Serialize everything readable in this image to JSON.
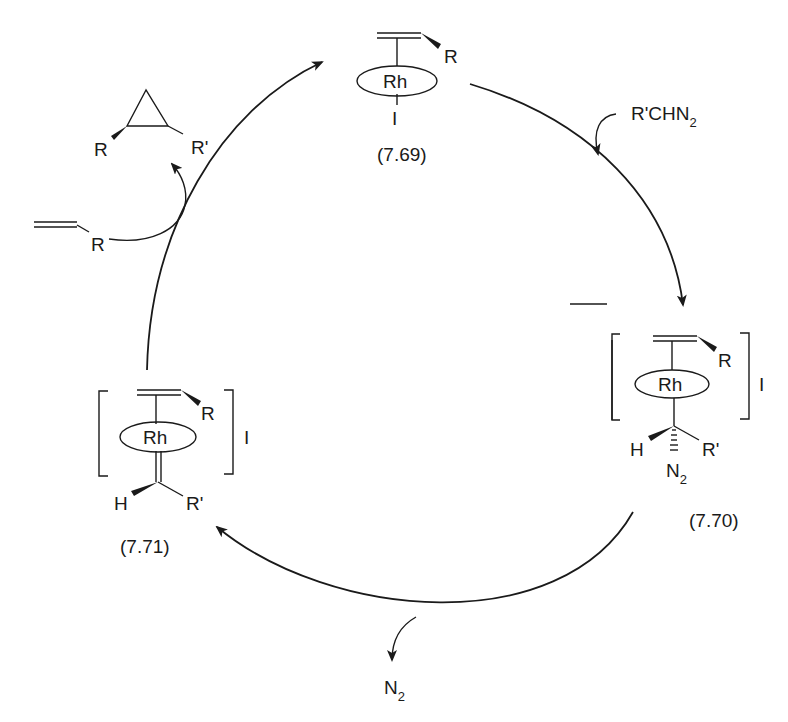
{
  "diagram": {
    "compounds": {
      "c769": {
        "label": "(7.69)",
        "metal": "Rh",
        "alkene_sub": "R",
        "ligand": "I"
      },
      "c770": {
        "label": "(7.70)",
        "metal": "Rh",
        "alkene_sub": "R",
        "counter": "I",
        "h": "H",
        "rprime": "R'",
        "n2_main": "N",
        "n2_sub": "2"
      },
      "c771": {
        "label": "(7.71)",
        "metal": "Rh",
        "alkene_sub": "R",
        "counter": "I",
        "h": "H",
        "rprime": "R'"
      }
    },
    "reagents": {
      "diazo_main": "R'CHN",
      "diazo_sub": "2",
      "alkene_sub": "R"
    },
    "products": {
      "cyclopropane_r": "R",
      "cyclopropane_rprime": "R'",
      "n2_main": "N",
      "n2_sub": "2"
    }
  }
}
